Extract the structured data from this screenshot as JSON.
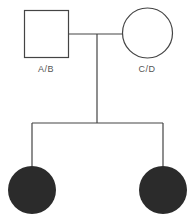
{
  "diagram": {
    "type": "pedigree",
    "colors": {
      "line": "#444444",
      "affected_fill": "#2b2b2b",
      "unaffected_fill": "#ffffff"
    },
    "parents": [
      {
        "sex": "male",
        "shape": "square",
        "affected": false,
        "label": "A/B"
      },
      {
        "sex": "female",
        "shape": "circle",
        "affected": false,
        "label": "C/D"
      }
    ],
    "children": [
      {
        "sex": "female",
        "shape": "circle",
        "affected": true,
        "label": ""
      },
      {
        "sex": "female",
        "shape": "circle",
        "affected": true,
        "label": ""
      }
    ]
  }
}
